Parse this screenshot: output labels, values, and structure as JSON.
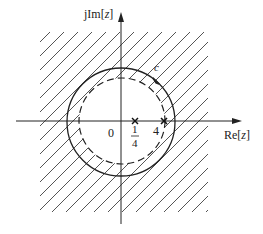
{
  "figure": {
    "axes": {
      "imag_label_prefix": "jIm[",
      "imag_label_var": "z",
      "imag_label_suffix": "]",
      "real_label_prefix": "Re[",
      "real_label_var": "z",
      "real_label_suffix": "]",
      "origin_label": "0"
    },
    "contour_label": "c",
    "poles": [
      {
        "label_num": "1",
        "label_den": "4",
        "value": 0.25
      },
      {
        "label": "4",
        "value": 4
      }
    ],
    "regions": {
      "hatched": "outside dashed circle (ROC annulus / exterior)",
      "solid_circle": "contour c",
      "dashed_circle": "boundary"
    },
    "colors": {
      "ink": "#222222",
      "hatch": "#555555",
      "background": "#ffffff"
    }
  }
}
